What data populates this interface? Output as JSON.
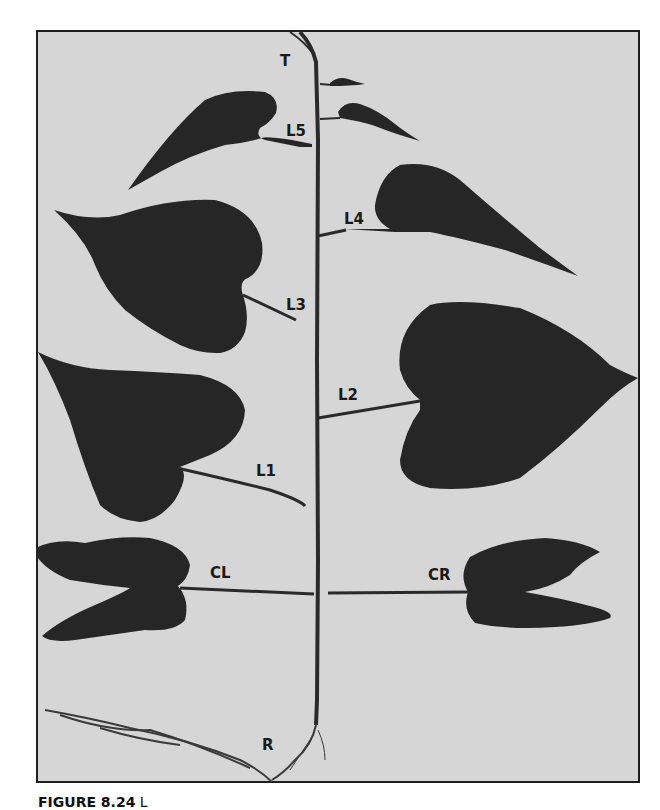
{
  "figure": {
    "labels": {
      "terminal": "T",
      "leaf5": "L5",
      "leaf4": "L4",
      "leaf3": "L3",
      "leaf2": "L2",
      "leaf1": "L1",
      "cotyledon_left": "CL",
      "cotyledon_right": "CR",
      "root": "R"
    },
    "caption_label": "FIGURE 8.24",
    "caption_text": " L"
  },
  "colors": {
    "background": "#d6d6d6",
    "leaf": "#262626",
    "frame": "#1e1e1e"
  }
}
